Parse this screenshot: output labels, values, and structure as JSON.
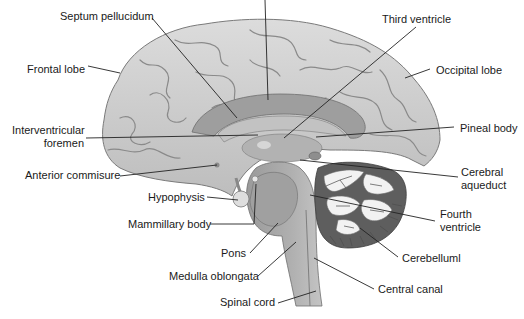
{
  "colors": {
    "cortex": "#c9c9c9",
    "cortex_highlight": "#e6e6e6",
    "sulcus": "#8a8a8a",
    "corpus_callosum": "#9e9e9e",
    "ventricle": "#b4b4b4",
    "brainstem": "#a3a3a3",
    "cerebellum_dark": "#5e5e5e",
    "arbor_vitae": "#f2f2f2",
    "leader_line": "#222222",
    "text": "#1a1a1a"
  },
  "labels": {
    "septum_pellucidum": "Septum pellucidum",
    "third_ventricle": "Third ventricle",
    "frontal_lobe": "Frontal lobe",
    "occipital_lobe": "Occipital lobe",
    "interventricular_foramen_line1": "Interventricular",
    "interventricular_foramen_line2": "foremen",
    "pineal_body": "Pineal body",
    "anterior_commissure": "Anterior commisure",
    "cerebral_aqueduct_line1": "Cerebral",
    "cerebral_aqueduct_line2": "aqueduct",
    "hypophysis": "Hypophysis",
    "mammillary_body": "Mammillary body",
    "fourth_ventricle_line1": "Fourth",
    "fourth_ventricle_line2": "ventricle",
    "pons": "Pons",
    "cerebellum": "Cerebelluml",
    "medulla_oblongata": "Medulla oblongata",
    "central_canal": "Central canal",
    "spinal_cord": "Spinal cord"
  }
}
